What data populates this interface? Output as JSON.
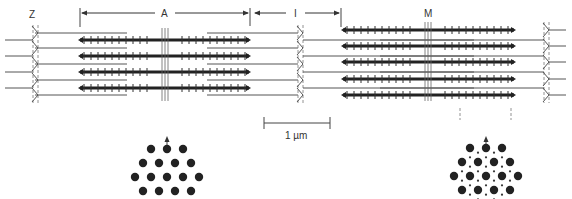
{
  "figure": {
    "labels": {
      "z": "Z",
      "a": "A",
      "i": "I",
      "m": "M",
      "scale": "1 µm"
    },
    "colors": {
      "thick_filament": "#222222",
      "thin_filament": "#555555",
      "z_line": "#777777",
      "dots": "#222222",
      "background": "#ffffff"
    },
    "left_sarcomere": {
      "state": "relaxed",
      "z_left_x": 35,
      "z_right_x": 300,
      "m_line_x": 165,
      "thick_filaments": {
        "x_start": 80,
        "x_end": 249,
        "y": [
          40,
          56,
          72,
          88
        ]
      },
      "thin_from_left_z": {
        "x_end": 127,
        "y": [
          33,
          48,
          64,
          80,
          95
        ]
      },
      "thin_from_right_z": {
        "x_start": 207,
        "y": [
          33,
          48,
          64,
          80,
          95
        ]
      }
    },
    "right_sarcomere": {
      "state": "contracted",
      "z_left_x": 300,
      "z_right_x": 546,
      "m_line_x": 428,
      "thick_filaments": {
        "x_start": 343,
        "x_end": 514,
        "y": [
          30,
          46,
          62,
          79,
          95
        ]
      },
      "thin_from_left_z": {
        "x_end": 474,
        "y": [
          40,
          56,
          72,
          88
        ]
      },
      "thin_from_right_z": {
        "x_start": 380,
        "y": [
          40,
          56,
          72,
          88
        ]
      }
    },
    "bands": {
      "a_band": {
        "x_start": 80,
        "x_end": 250,
        "y": 13
      },
      "i_band": {
        "x_start": 253,
        "x_end": 341,
        "y": 13
      }
    },
    "scale_bar": {
      "x_start": 264,
      "x_end": 330,
      "y": 123,
      "label": "1 µm"
    },
    "cross_sections": [
      {
        "name": "a-band-cross-section",
        "cx": 167,
        "cy": 177,
        "spacing": 16,
        "row_step": 14,
        "has_thin_dots": false,
        "arrow_x": 167
      },
      {
        "name": "overlap-cross-section",
        "cx": 486,
        "cy": 176,
        "spacing": 16,
        "row_step": 14,
        "has_thin_dots": true,
        "arrow_x": 486
      }
    ]
  }
}
